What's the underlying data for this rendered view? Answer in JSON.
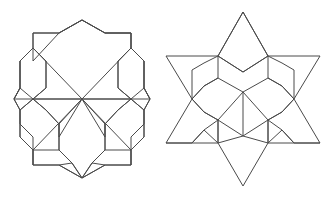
{
  "page": {
    "background_color": "#ffffff",
    "width": 326,
    "height": 197
  },
  "style": {
    "stroke_color": "#4a4a4a",
    "stroke_width": 1,
    "fill": "none"
  },
  "figures": [
    {
      "id": "left-figure",
      "name": "hexagonal-rosette-outline",
      "description": "Twelve-sided rosette outline filled with three interlocking hexagon-petal shapes meeting at a common center point",
      "center": [
        82,
        99
      ],
      "bounds": [
        14,
        18,
        150,
        182
      ],
      "paths": [
        "M 82 20 L 105 33 L 131 33 L 131 48 L 144 61 L 144 88 L 150 99 L 144 110 L 144 137 L 131 150 L 131 165 L 105 165 L 82 178 L 59 165 L 33 165 L 33 150 L 20 137 L 20 110 L 14 99 L 20 88 L 20 61 L 33 48 L 33 61 L 59 33 L 82 20 Z",
        "M 82 20 L 105 33 L 131 33 L 131 48 L 144 61 L 144 88 L 150 99 L 144 110 L 144 137 L 131 150 L 131 165 L 105 165 L 82 178 L 59 165 L 33 165 L 33 150 L 20 137 L 20 110 L 14 99 L 20 88 L 20 61 L 33 48 L 33 33 L 59 33 L 82 20 Z",
        "M 82 99 L 33 48 L 33 33 L 59 33 L 82 20 L 105 33 L 131 33 L 131 48 Z",
        "M 82 99 L 14 99 L 20 88 L 20 61 L 33 48 L 46 61 L 46 88 L 33 99 Z",
        "M 82 99 L 150 99 L 144 88 L 144 61 L 131 48 L 118 61 L 118 88 L 131 99 Z",
        "M 82 99 L 33 150 L 33 137 L 20 124 L 20 110 L 33 99 L 46 110 L 59 124 L 59 137 Z",
        "M 82 99 L 131 150 L 131 137 L 144 124 L 144 110 L 131 99 L 118 110 L 105 124 L 105 137 Z",
        "M 82 99 L 59 124 L 59 150 L 72 163 L 82 178 L 92 163 L 105 150 L 105 124 Z",
        "M 33 99 L 46 88 L 46 61 L 33 48",
        "M 131 99 L 118 88 L 118 61 L 131 48",
        "M 33 99 L 46 110 L 59 124",
        "M 131 99 L 118 110 L 105 124",
        "M 33 150 L 59 150 L 72 163 L 82 178",
        "M 131 150 L 105 150 L 92 163 L 82 178",
        "M 59 124 L 59 150",
        "M 105 124 L 105 150",
        "M 20 110 L 33 99 L 20 88",
        "M 144 110 L 131 99 L 144 88",
        "M 33 165 L 33 150",
        "M 131 165 L 131 150",
        "M 59 165 L 72 163",
        "M 105 165 L 92 163"
      ]
    },
    {
      "id": "right-figure",
      "name": "six-pointed-star-outline",
      "description": "Large six-pointed star outline containing a nested smaller six-pointed star and kite-shaped tile subdivisions",
      "center": [
        243,
        99
      ],
      "bounds": [
        166,
        12,
        320,
        186
      ],
      "paths": [
        "M 243 12 L 268 56 L 320 56 L 294 99 L 320 143 L 268 143 L 243 186 L 218 143 L 166 143 L 192 99 L 166 56 L 218 56 Z",
        "M 243 12 L 268 56 L 243 72 L 218 56 Z",
        "M 218 56 L 243 72 L 268 56",
        "M 218 56 L 218 78 L 243 92 L 268 78 L 268 56",
        "M 218 78 L 204 86 L 192 99 L 204 112",
        "M 268 78 L 282 86 L 294 99 L 282 112",
        "M 192 99 L 204 112 L 218 120 L 218 143",
        "M 294 99 L 282 112 L 268 120 L 268 143",
        "M 243 92 L 218 120 L 243 136 L 268 120 Z",
        "M 243 92 L 243 136",
        "M 218 120 L 204 112",
        "M 268 120 L 282 112",
        "M 218 143 L 243 136 L 268 143",
        "M 218 143 L 218 120",
        "M 268 143 L 268 120",
        "M 204 86 L 218 78",
        "M 282 86 L 268 78",
        "M 192 99 L 204 86",
        "M 294 99 L 282 86",
        "M 166 143 L 192 143 L 204 130 L 218 143",
        "M 320 143 L 294 143 L 282 130 L 268 143",
        "M 192 143 L 204 130 L 218 120",
        "M 294 143 L 282 130 L 268 120",
        "M 218 56 L 204 63 L 192 70 L 192 99",
        "M 268 56 L 282 63 L 294 70 L 294 99"
      ]
    }
  ]
}
